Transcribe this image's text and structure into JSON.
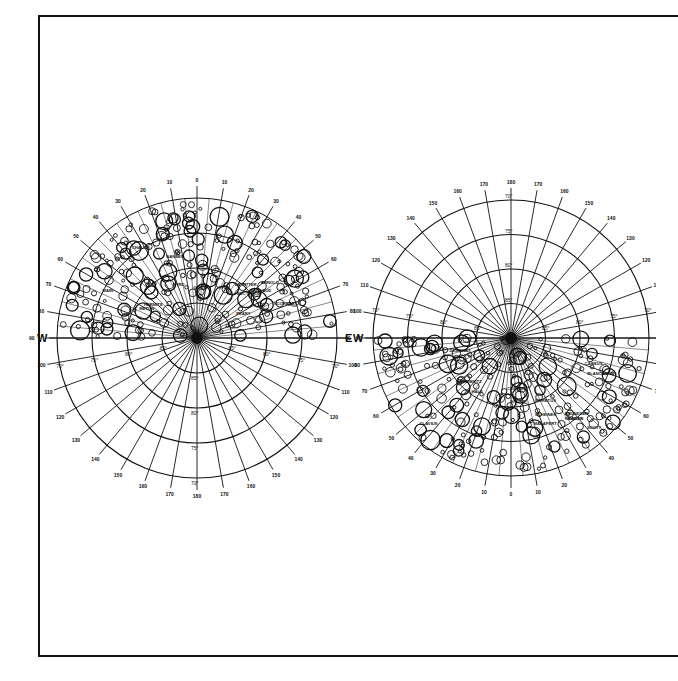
{
  "maps": [
    {
      "id": "north-polar",
      "cardinal": {
        "west": "W",
        "east": "E",
        "west_lon": "90",
        "east_lon": "90"
      },
      "dense_half": "top",
      "outer_lon_labels": [
        "90",
        "80",
        "70",
        "60",
        "50",
        "40",
        "30",
        "20",
        "10",
        "0",
        "10",
        "20",
        "30",
        "40",
        "50",
        "60",
        "70",
        "80",
        "90"
      ],
      "grid_lon_labels": [
        "100",
        "110",
        "120",
        "130",
        "140",
        "150",
        "160",
        "170",
        "180",
        "170",
        "160",
        "150",
        "140",
        "130",
        "120",
        "110",
        "100"
      ],
      "lat_labels": [
        "85°",
        "80°",
        "75°",
        "70°"
      ],
      "crater_names": [
        "METON",
        "EUCTEMON",
        "BAILLAUD",
        "PEARY",
        "NANSEN",
        "GIOJA",
        "BYRD",
        "HERMITE",
        "SCORESBY",
        "CHALLIS",
        "MAIN",
        "ARNOLD",
        "DE SITTER"
      ]
    },
    {
      "id": "south-polar",
      "cardinal": {
        "west": "W",
        "east": "E",
        "west_lon": "90",
        "east_lon": "90"
      },
      "dense_half": "bottom",
      "outer_lon_labels": [
        "90",
        "80",
        "70",
        "60",
        "50",
        "40",
        "30",
        "20",
        "10",
        "0",
        "10",
        "20",
        "30",
        "40",
        "50",
        "60",
        "70",
        "80",
        "90"
      ],
      "grid_lon_labels": [
        "100",
        "110",
        "120",
        "130",
        "140",
        "150",
        "160",
        "170",
        "180",
        "170",
        "160",
        "150",
        "140",
        "130",
        "120",
        "110",
        "100"
      ],
      "lat_labels": [
        "85°",
        "80°",
        "75°",
        "70°"
      ],
      "crater_names": [
        "BAILLY",
        "NEWTON",
        "MORETUS",
        "CURTIUS",
        "CLAVIUS",
        "SCHEINER",
        "BLANCANUS",
        "AMUNDSEN",
        "SCOTT",
        "DEMONAX",
        "SHORT",
        "CABEUS",
        "MALAPERT",
        "LEIBNITZ",
        "HALE"
      ]
    }
  ]
}
